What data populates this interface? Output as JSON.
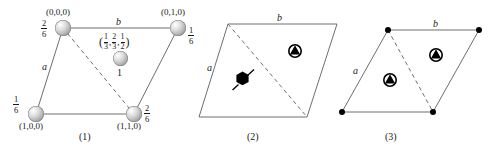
{
  "figure": {
    "type": "crystallographic-unit-cell-diagram",
    "panel_count": 3,
    "colors": {
      "line": "#6f6f6f",
      "text": "#1a1a1a",
      "glyph": "#000000",
      "sphere_light": "#ffffff",
      "sphere_dark": "#6e6e6e"
    }
  },
  "panel1": {
    "caption": "(1)",
    "edge_labels": {
      "a": "a",
      "b": "b"
    },
    "atoms": [
      {
        "name": "top-left",
        "coord": "(0,0,0)",
        "occ_num": "2",
        "occ_den": "6"
      },
      {
        "name": "top-right",
        "coord": "(0,1,0)",
        "occ_num": "1",
        "occ_den": "6"
      },
      {
        "name": "bottom-left",
        "coord": "(1,0,0)",
        "occ_num": "1",
        "occ_den": "6"
      },
      {
        "name": "bottom-right",
        "coord": "(1,1,0)",
        "occ_num": "2",
        "occ_den": "6"
      },
      {
        "name": "interior",
        "coord_parts": {
          "open": "(",
          "x_n": "1",
          "x_d": "3",
          "y_n": "2",
          "y_d": "3",
          "z_n": "1",
          "z_d": "2",
          "close": ")",
          "sep": ","
        },
        "occ": "1"
      }
    ]
  },
  "panel2": {
    "caption": "(2)",
    "edge_labels": {
      "a": "a",
      "b": "b"
    },
    "symbols": [
      {
        "name": "six-fold-screw-axis-icon",
        "kind": "filled-hexagon-with-tail",
        "position": "left-lower-triangle"
      },
      {
        "name": "three-fold-axis-icon",
        "kind": "triangle-in-circle",
        "position": "right-upper-triangle"
      }
    ]
  },
  "panel3": {
    "caption": "(3)",
    "edge_labels": {
      "a": "a",
      "b": "b"
    },
    "lattice_points": 4,
    "symbols": [
      {
        "name": "three-fold-axis-icon",
        "kind": "triangle-in-circle",
        "position": "left-lower-triangle"
      },
      {
        "name": "three-fold-axis-icon",
        "kind": "triangle-in-circle",
        "position": "right-upper-triangle"
      }
    ]
  }
}
